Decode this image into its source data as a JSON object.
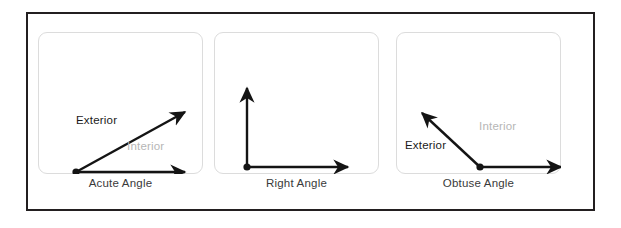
{
  "figure": {
    "border_color": "#231f20",
    "background": "#ffffff",
    "card_border_color": "#dcdcdc"
  },
  "labels": {
    "exterior": "Exterior",
    "interior": "Interior",
    "exterior_color": "#1a1a1a",
    "interior_color": "#b6b6b6"
  },
  "panels": [
    {
      "id": "acute",
      "caption": "Acute Angle",
      "exterior_label": "Exterior",
      "interior_label": "Interior",
      "vertex": [
        38,
        140
      ],
      "ray_a_tip": [
        154,
        76
      ],
      "ray_b_tip": [
        154,
        140
      ]
    },
    {
      "id": "right",
      "caption": "Right Angle",
      "exterior_label": "",
      "interior_label": "",
      "vertex": [
        33,
        135
      ],
      "ray_a_tip": [
        33,
        49
      ],
      "ray_b_tip": [
        141,
        135
      ]
    },
    {
      "id": "obtuse",
      "caption": "Obtuse Angle",
      "exterior_label": "Exterior",
      "interior_label": "Interior",
      "vertex": [
        84,
        135
      ],
      "ray_a_tip": [
        19,
        74
      ],
      "ray_b_tip": [
        172,
        135
      ]
    }
  ]
}
